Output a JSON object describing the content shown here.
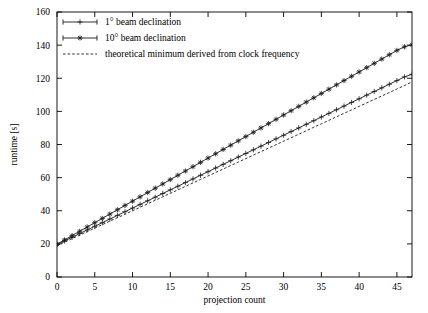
{
  "chart_data": {
    "type": "line",
    "title": "",
    "xlabel": "projection count",
    "ylabel": "runtime [s]",
    "xlim": [
      0,
      47
    ],
    "ylim": [
      0,
      160
    ],
    "xticks": [
      0,
      5,
      10,
      15,
      20,
      25,
      30,
      35,
      40,
      45
    ],
    "yticks": [
      0,
      20,
      40,
      60,
      80,
      100,
      120,
      140,
      160
    ],
    "xticklabels": [
      "0",
      "5",
      "10",
      "15",
      "20",
      "25",
      "30",
      "35",
      "40",
      "45"
    ],
    "yticklabels": [
      "0",
      "20",
      "40",
      "60",
      "80",
      "100",
      "120",
      "140",
      "160"
    ],
    "grid": false,
    "legend_position": "upper left inside",
    "x": [
      0,
      1,
      2,
      3,
      4,
      5,
      6,
      7,
      8,
      9,
      10,
      11,
      12,
      13,
      14,
      15,
      16,
      17,
      18,
      19,
      20,
      21,
      22,
      23,
      24,
      25,
      26,
      27,
      28,
      29,
      30,
      31,
      32,
      33,
      34,
      35,
      36,
      37,
      38,
      39,
      40,
      41,
      42,
      43,
      44,
      45,
      46,
      47
    ],
    "series": [
      {
        "name": "1° beam declination",
        "marker": "plus",
        "linestyle": "solid",
        "color": "#1a1a1a",
        "values": [
          19.6,
          21.8,
          24.0,
          26.2,
          28.4,
          30.6,
          32.8,
          35.0,
          37.2,
          39.4,
          41.6,
          43.8,
          46.0,
          48.2,
          50.4,
          52.6,
          54.8,
          57.0,
          59.2,
          61.4,
          63.6,
          65.8,
          68.0,
          70.2,
          72.4,
          74.6,
          76.8,
          79.0,
          81.2,
          83.4,
          85.6,
          87.8,
          90.0,
          92.2,
          94.4,
          96.6,
          98.8,
          101.0,
          103.2,
          105.4,
          107.6,
          109.8,
          112.0,
          114.2,
          116.4,
          118.6,
          120.8,
          122.4
        ]
      },
      {
        "name": "10° beam declination",
        "marker": "star",
        "linestyle": "solid",
        "color": "#1a1a1a",
        "values": [
          19.8,
          22.4,
          25.0,
          27.6,
          30.2,
          32.8,
          35.4,
          38.0,
          40.6,
          43.2,
          45.8,
          48.4,
          51.0,
          53.6,
          56.2,
          58.8,
          61.4,
          64.0,
          66.6,
          69.2,
          71.8,
          74.4,
          77.0,
          79.6,
          82.2,
          84.8,
          87.4,
          90.0,
          92.6,
          95.2,
          97.8,
          100.4,
          103.0,
          105.6,
          108.2,
          110.8,
          113.4,
          116.0,
          118.6,
          121.2,
          123.8,
          126.4,
          129.0,
          131.6,
          134.2,
          136.8,
          139.0,
          140.2
        ]
      },
      {
        "name": "theoretical minimum derived from clock frequency",
        "marker": "none",
        "linestyle": "dashed",
        "color": "#1a1a1a",
        "values": [
          19.0,
          21.1,
          23.2,
          25.3,
          27.4,
          29.5,
          31.6,
          33.7,
          35.8,
          37.9,
          40.0,
          42.1,
          44.2,
          46.3,
          48.4,
          50.5,
          52.6,
          54.7,
          56.8,
          58.9,
          61.0,
          63.1,
          65.2,
          67.3,
          69.4,
          71.5,
          73.6,
          75.7,
          77.8,
          79.9,
          82.0,
          84.1,
          86.2,
          88.3,
          90.4,
          92.5,
          94.6,
          96.7,
          98.8,
          100.9,
          103.0,
          105.1,
          107.2,
          109.3,
          111.4,
          113.5,
          115.6,
          117.8
        ]
      }
    ]
  },
  "legend": {
    "entries": [
      {
        "label": "1° beam declination"
      },
      {
        "label": "10° beam declination"
      },
      {
        "label": "theoretical minimum derived from clock frequency"
      }
    ]
  }
}
